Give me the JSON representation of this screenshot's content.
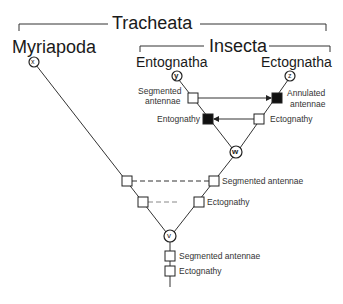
{
  "groups": {
    "tracheata": "Tracheata",
    "insecta": "Insecta"
  },
  "taxa": {
    "myriapoda": "Myriapoda",
    "entognatha": "Entognatha",
    "ectognatha": "Ectognatha"
  },
  "nodes": {
    "x": "x",
    "y": "y",
    "z": "z",
    "w": "w",
    "v": "v"
  },
  "characters": {
    "y_segmented": "Segmented",
    "y_antennae": "antennae",
    "z_annulated": "Annulated",
    "z_antennae": "antennae",
    "entognathy": "Entognathy",
    "ectognathy_w": "Ectognathy",
    "segmented_antennae_mid": "Segmented antennae",
    "ectognathy_mid": "Ectognathy",
    "segmented_antennae_stem": "Segmented antennae",
    "ectognathy_stem": "Ectognathy"
  },
  "colors": {
    "line": "#333333",
    "filled_character": "#111111",
    "open_character": "#ffffff"
  }
}
